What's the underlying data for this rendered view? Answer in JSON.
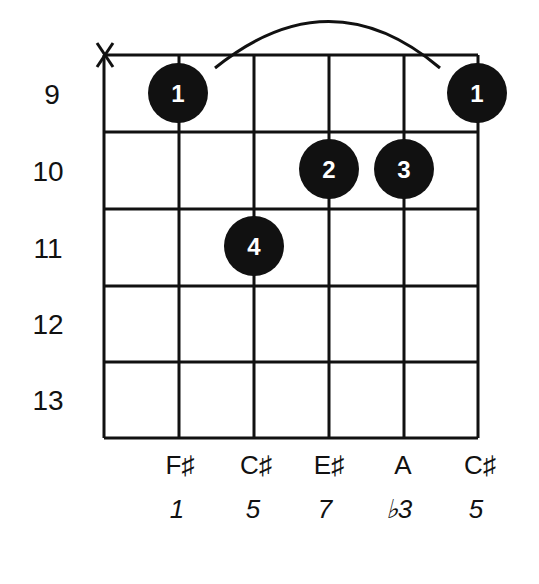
{
  "diagram": {
    "type": "guitar-chord-chart",
    "muted_marker": "X",
    "frets": [
      "9",
      "10",
      "11",
      "12",
      "13"
    ],
    "strings": [
      {
        "note": "",
        "interval": "",
        "status": "muted"
      },
      {
        "note": "F♯",
        "interval": "1"
      },
      {
        "note": "C♯",
        "interval": "5"
      },
      {
        "note": "E♯",
        "interval": "7"
      },
      {
        "note": "A",
        "interval": "♭3"
      },
      {
        "note": "C♯",
        "interval": "5"
      }
    ],
    "fingers": [
      {
        "label": "1",
        "string": 2,
        "fret": "9"
      },
      {
        "label": "1",
        "string": 6,
        "fret": "9"
      },
      {
        "label": "2",
        "string": 4,
        "fret": "10"
      },
      {
        "label": "3",
        "string": 5,
        "fret": "10"
      },
      {
        "label": "4",
        "string": 3,
        "fret": "11"
      }
    ],
    "barre": {
      "from_string": 2,
      "to_string": 6,
      "fret": "9"
    }
  }
}
